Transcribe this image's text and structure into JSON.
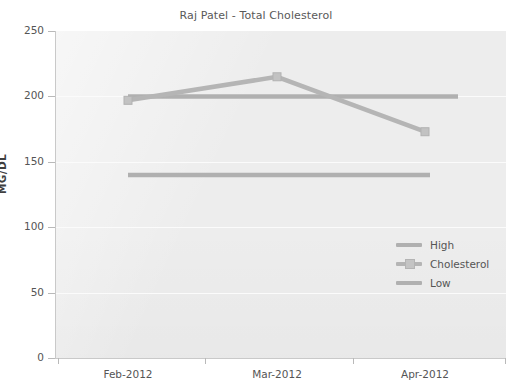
{
  "chart_data": {
    "type": "line",
    "title": "Raj Patel - Total Cholesterol",
    "xlabel": "",
    "ylabel": "MG/DL",
    "categories": [
      "Feb-2012",
      "Mar-2012",
      "Apr-2012"
    ],
    "x_tick_labels": [
      "Feb-2012",
      "Mar-2012",
      "Apr-2012"
    ],
    "y_tick_labels": [
      "0",
      "50",
      "100",
      "150",
      "200",
      "250"
    ],
    "y_ticks": [
      0,
      50,
      100,
      150,
      200,
      250
    ],
    "ylim": [
      0,
      250
    ],
    "grid": true,
    "legend_position": "inside-right",
    "series": [
      {
        "name": "High",
        "type": "threshold-line",
        "color": "#b0b0b0",
        "values": [
          200,
          200,
          200
        ],
        "markers": false
      },
      {
        "name": "Cholesterol",
        "type": "line",
        "color": "#b5b5b5",
        "values": [
          197,
          215,
          173
        ],
        "markers": true
      },
      {
        "name": "Low",
        "type": "threshold-line",
        "color": "#b0b0b0",
        "values": [
          140,
          140,
          140
        ],
        "markers": false
      }
    ]
  },
  "legend": {
    "items": [
      {
        "label": "High",
        "color": "#b0b0b0",
        "marker": false
      },
      {
        "label": "Cholesterol",
        "color": "#b5b5b5",
        "marker": true
      },
      {
        "label": "Low",
        "color": "#b0b0b0",
        "marker": false
      }
    ]
  },
  "colors": {
    "plot_background": "#ededed",
    "page_background": "#ffffff",
    "gridline": "#fbfbfb",
    "axis": "#c9c9c9",
    "text": "#555555",
    "series_high": "#b0b0b0",
    "series_cholesterol": "#b5b5b5",
    "series_low": "#b0b0b0"
  }
}
